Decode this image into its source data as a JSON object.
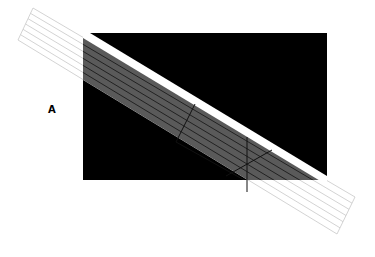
{
  "diagram": {
    "label": "A",
    "colors": {
      "background": "#ffffff",
      "block": "#000000",
      "band_overlay": "#5a5a5a",
      "band_lines_on_white": "#c8c8c8",
      "band_lines_on_dark": "#222222",
      "highlight_stripe": "#ffffff",
      "construction_lines": "#111111"
    },
    "band_line_count": 6
  }
}
